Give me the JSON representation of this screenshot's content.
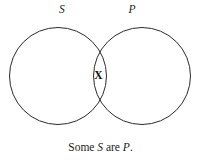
{
  "figure": {
    "type": "venn-diagram",
    "background_color": "#ffffff",
    "stroke_color": "#2b2b2b",
    "stroke_width": 1,
    "labels": {
      "left_circle": "S",
      "right_circle": "P"
    },
    "markers": {
      "intersection": "X"
    },
    "caption": {
      "full_text": "Some S are P.",
      "part_1": "Some ",
      "part_var_1": "S",
      "part_2": " are ",
      "part_var_2": "P",
      "part_3": "."
    },
    "geometry": {
      "left_circle": {
        "cx": 58,
        "cy": 76,
        "r": 48.5
      },
      "right_circle": {
        "cx": 142,
        "cy": 76,
        "r": 48.5
      }
    }
  }
}
